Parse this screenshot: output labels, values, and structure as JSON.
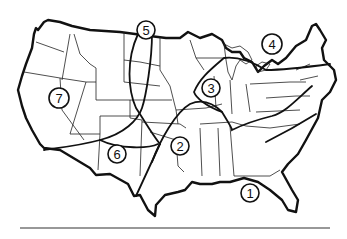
{
  "diagram": {
    "type": "map",
    "regions": [
      {
        "id": 1,
        "label": "1",
        "x": 250,
        "y": 193
      },
      {
        "id": 2,
        "label": "2",
        "x": 180,
        "y": 146
      },
      {
        "id": 3,
        "label": "3",
        "x": 211,
        "y": 88
      },
      {
        "id": 4,
        "label": "4",
        "x": 272,
        "y": 44
      },
      {
        "id": 5,
        "label": "5",
        "x": 146,
        "y": 30
      },
      {
        "id": 6,
        "label": "6",
        "x": 117,
        "y": 154
      },
      {
        "id": 7,
        "label": "7",
        "x": 59,
        "y": 98
      }
    ]
  }
}
